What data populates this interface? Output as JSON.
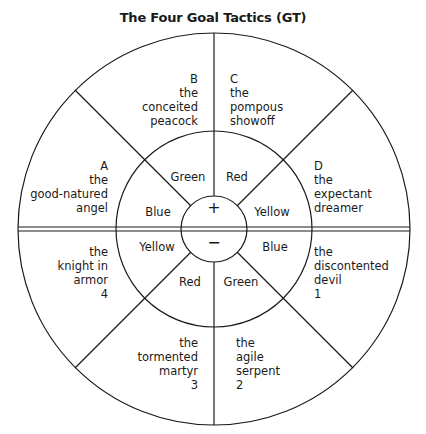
{
  "title": "The Four Goal Tactics (GT)",
  "geometry": {
    "center": [
      214,
      229
    ],
    "outer_radius": 196,
    "middle_radius": 98,
    "inner_radius": 33,
    "line_color": "#1a1a1a"
  },
  "center": {
    "top_sign": "+",
    "bottom_sign": "−"
  },
  "upper_half": {
    "colors": {
      "left": "Blue",
      "upper_left": "Green",
      "upper_right": "Red",
      "right": "Yellow"
    },
    "types": [
      {
        "lines": [
          "A",
          "the",
          "good-natured",
          "angel"
        ]
      },
      {
        "lines": [
          "B",
          "the",
          "conceited",
          "peacock"
        ]
      },
      {
        "lines": [
          "C",
          "the",
          "pompous",
          "showoff"
        ]
      },
      {
        "lines": [
          "D",
          "the",
          "expectant",
          "dreamer"
        ]
      }
    ]
  },
  "lower_half": {
    "colors": {
      "left": "Yellow",
      "lower_left": "Red",
      "lower_right": "Green",
      "right": "Blue"
    },
    "types": [
      {
        "lines": [
          "the",
          "knight in",
          "armor",
          "4"
        ]
      },
      {
        "lines": [
          "the",
          "tormented",
          "martyr",
          "3"
        ]
      },
      {
        "lines": [
          "the",
          "agile",
          "serpent",
          "2"
        ]
      },
      {
        "lines": [
          "the",
          "discontented",
          "devil",
          "1"
        ]
      }
    ]
  }
}
